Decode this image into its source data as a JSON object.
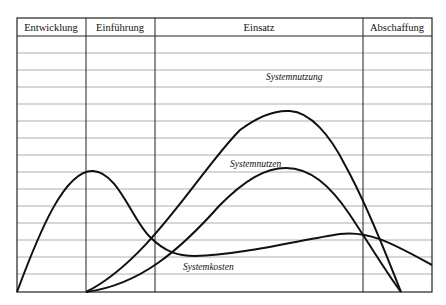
{
  "diagram": {
    "title": "",
    "phases": [
      {
        "label": "Entwicklung"
      },
      {
        "label": "Einführung"
      },
      {
        "label": "Einsatz"
      },
      {
        "label": "Abschaffung"
      }
    ],
    "curves": [
      {
        "label": "Systemnutzung"
      },
      {
        "label": "Systemnutzen"
      },
      {
        "label": "Systemkosten"
      }
    ],
    "colors": {
      "curve": "#111111",
      "grid": "#9a9a9a",
      "frame": "#222222"
    }
  }
}
